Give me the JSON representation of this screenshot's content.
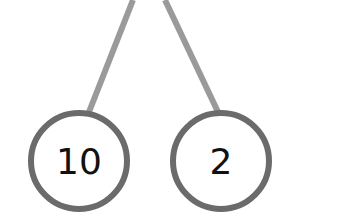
{
  "diagram": {
    "type": "number-bond",
    "colors": {
      "branch": "#9a9a9a",
      "circle_stroke": "#6b6b6b",
      "text": "#111111",
      "background": "#ffffff"
    },
    "parts": [
      {
        "label": "10"
      },
      {
        "label": "2"
      }
    ]
  }
}
